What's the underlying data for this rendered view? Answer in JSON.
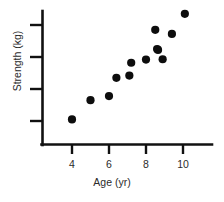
{
  "chart_data": {
    "type": "scatter",
    "title": "",
    "xlabel": "Age (yr)",
    "ylabel": "Strength (kg)",
    "xlim": [
      3.0,
      11.6
    ],
    "ylim": [
      0,
      5
    ],
    "grid": false,
    "legend": null,
    "xticks": [
      4,
      6,
      8,
      10
    ],
    "xtick_labels": [
      "4",
      "6",
      "8",
      "10"
    ],
    "yticks": [
      1,
      2,
      3,
      4
    ],
    "ytick_labels": [
      "",
      "",
      "",
      ""
    ],
    "marker": "filled-circle",
    "marker_color": "#0d0d0d",
    "points": [
      {
        "x": 4.0,
        "y": 1.05
      },
      {
        "x": 5.0,
        "y": 1.65
      },
      {
        "x": 6.0,
        "y": 1.78
      },
      {
        "x": 6.4,
        "y": 2.35
      },
      {
        "x": 7.1,
        "y": 2.42
      },
      {
        "x": 7.2,
        "y": 2.82
      },
      {
        "x": 8.0,
        "y": 2.92
      },
      {
        "x": 8.5,
        "y": 3.85
      },
      {
        "x": 8.6,
        "y": 3.25
      },
      {
        "x": 8.9,
        "y": 2.93
      },
      {
        "x": 9.4,
        "y": 3.72
      },
      {
        "x": 10.1,
        "y": 4.35
      },
      {
        "x": 8.65,
        "y": 3.22
      }
    ]
  },
  "axes": {
    "x_tick_values": [
      "4",
      "6",
      "8",
      "10"
    ],
    "x_axis_label": "Age (yr)",
    "y_axis_label": "Strength (kg)",
    "y_tick_count": 4
  }
}
